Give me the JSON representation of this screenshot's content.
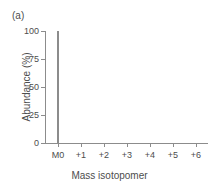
{
  "panel": {
    "label": "(a)"
  },
  "colors": {
    "background": "#ffffff",
    "axis": "#8c8c8c",
    "text": "#4d4d4d",
    "bar": "#8c8c8c"
  },
  "chart_data": {
    "type": "bar",
    "title": "",
    "subtitle": "",
    "panel_label": "(a)",
    "xlabel": "Mass isotopomer",
    "ylabel": "Abundance (%)",
    "categories": [
      "M0",
      "+1",
      "+2",
      "+3",
      "+4",
      "+5",
      "+6"
    ],
    "values": [
      100,
      0,
      0,
      0,
      0,
      0,
      0
    ],
    "ylim": [
      0,
      100
    ],
    "yticks": [
      0,
      25,
      50,
      75,
      100
    ],
    "ytick_labels": [
      "0",
      "25",
      "50",
      "75",
      "100"
    ],
    "xtick_labels": [
      "M0",
      "+1",
      "+2",
      "+3",
      "+4",
      "+5",
      "+6"
    ],
    "grid": false,
    "legend": false,
    "legend_position": "none"
  }
}
